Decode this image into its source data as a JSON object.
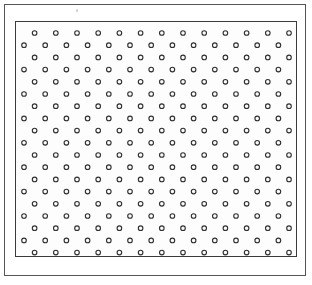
{
  "figure": {
    "title": "Staggered circle lattice plate",
    "caption": "",
    "background_color": "#ffffff"
  },
  "outer_frame": {
    "stroke_color": "#555555",
    "stroke_width": 1,
    "x": 4,
    "y": 4,
    "width": 302,
    "height": 272
  },
  "lattice_frame": {
    "stroke_color": "#3a3a3a",
    "stroke_width": 1,
    "fill_color": "#fdfdfd",
    "x": 15,
    "y": 21,
    "width": 282,
    "height": 236
  },
  "markings": {
    "scan_speck": {
      "label": "faint scan speck",
      "x": 76,
      "y": 9,
      "color": "#b9b4b8"
    }
  },
  "chart_data": {
    "type": "scatter",
    "title": "Staggered circle lattice plate",
    "subtitle": "",
    "xlabel": "",
    "ylabel": "",
    "grid": false,
    "legend_position": "none",
    "xlim": [
      0,
      282
    ],
    "ylim": [
      0,
      236
    ],
    "lattice": {
      "arrangement": "staggered-hexagonal",
      "row_count": 20,
      "row_spacing": 12.2,
      "column_spacing": 21.2,
      "first_row_offset": 10.6,
      "first_row_y": 11.0,
      "first_column_x": 8.0,
      "even_row_dot_count": 14,
      "odd_row_dot_count": 13,
      "total_dot_count": 270,
      "marker": {
        "shape": "circle-outline",
        "radius": 2.3,
        "stroke_color": "#2f2f2f",
        "stroke_width": 1.1,
        "fill_color": "#fbfbfb"
      }
    },
    "rows": [
      {
        "index": 1,
        "y": 11.0,
        "offset": true,
        "count": 13
      },
      {
        "index": 2,
        "y": 23.2,
        "offset": false,
        "count": 14
      },
      {
        "index": 3,
        "y": 35.4,
        "offset": true,
        "count": 13
      },
      {
        "index": 4,
        "y": 47.6,
        "offset": false,
        "count": 14
      },
      {
        "index": 5,
        "y": 59.8,
        "offset": true,
        "count": 13
      },
      {
        "index": 6,
        "y": 72.0,
        "offset": false,
        "count": 14
      },
      {
        "index": 7,
        "y": 84.2,
        "offset": true,
        "count": 13
      },
      {
        "index": 8,
        "y": 96.4,
        "offset": false,
        "count": 14
      },
      {
        "index": 9,
        "y": 108.6,
        "offset": true,
        "count": 13
      },
      {
        "index": 10,
        "y": 120.8,
        "offset": false,
        "count": 14
      },
      {
        "index": 11,
        "y": 133.0,
        "offset": true,
        "count": 13
      },
      {
        "index": 12,
        "y": 145.2,
        "offset": false,
        "count": 14
      },
      {
        "index": 13,
        "y": 157.4,
        "offset": true,
        "count": 13
      },
      {
        "index": 14,
        "y": 169.6,
        "offset": false,
        "count": 14
      },
      {
        "index": 15,
        "y": 181.8,
        "offset": true,
        "count": 13
      },
      {
        "index": 16,
        "y": 194.0,
        "offset": false,
        "count": 14
      },
      {
        "index": 17,
        "y": 206.2,
        "offset": true,
        "count": 13
      },
      {
        "index": 18,
        "y": 218.4,
        "offset": false,
        "count": 14
      },
      {
        "index": 19,
        "y": 230.6,
        "offset": true,
        "count": 13
      },
      {
        "index": 20,
        "y": 242.8,
        "offset": false,
        "count": 14
      }
    ]
  }
}
